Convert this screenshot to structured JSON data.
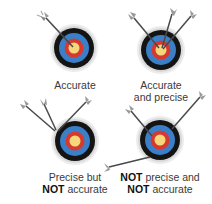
{
  "colors": {
    "outer_ring": "#d8d8d8",
    "black_ring": "#141414",
    "blue_ring": "#3a7fc8",
    "red_ring": "#d63a2e",
    "yellow_center": "#f6d77c",
    "arrow_shaft": "#4a4a4a",
    "arrow_fletching": "#9a9a9a"
  },
  "panels": [
    {
      "id": "accurate",
      "label_line1": "Accurate",
      "label_line2": ""
    },
    {
      "id": "accurate-and-precise",
      "label_line1": "Accurate",
      "label_line2": "and precise"
    },
    {
      "id": "precise-not-accurate",
      "label_line1": "Precise but",
      "label_line2_bold": "NOT",
      "label_line2_rest": " accurate"
    },
    {
      "id": "not-precise-not-accurate",
      "label_line1_bold": "NOT",
      "label_line1_rest": " precise and",
      "label_line2_bold": "NOT",
      "label_line2_rest": " accurate"
    }
  ]
}
